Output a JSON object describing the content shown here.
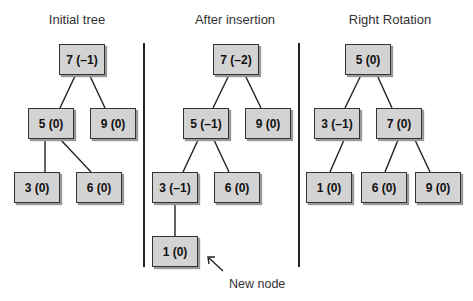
{
  "panels": [
    {
      "title": "Initial tree",
      "nodes": {
        "root": "7 (–1)",
        "left": "5 (0)",
        "right": "9 (0)",
        "left_left": "3 (0)",
        "left_right": "6 (0)"
      }
    },
    {
      "title": "After insertion",
      "nodes": {
        "root": "7 (–2)",
        "left": "5 (–1)",
        "right": "9 (0)",
        "left_left": "3 (–1)",
        "left_right": "6 (0)",
        "left_left_left": "1 (0)"
      },
      "annotation": "New node"
    },
    {
      "title": "Right Rotation",
      "nodes": {
        "root": "5 (0)",
        "left": "3 (–1)",
        "right": "7 (0)",
        "left_left": "1 (0)",
        "right_left": "6 (0)",
        "right_right": "9 (0)"
      }
    }
  ],
  "colors": {
    "node_fill": "#d3d3d3",
    "node_border": "#333333",
    "line": "#222222"
  }
}
